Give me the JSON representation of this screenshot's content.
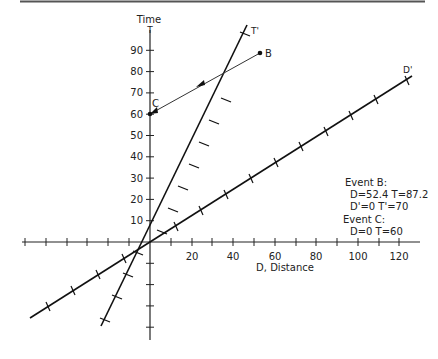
{
  "diagram": {
    "axes": {
      "y_label_top": "Time",
      "y_label_symbol": "T",
      "x_label": "D, Distance",
      "y_ticks": [
        "10",
        "20",
        "30",
        "40",
        "50",
        "60",
        "70",
        "80",
        "90"
      ],
      "x_ticks": [
        "20",
        "40",
        "60",
        "80",
        "100",
        "120"
      ]
    },
    "lines": {
      "t_prime": "T'",
      "d_prime": "D'"
    },
    "points": {
      "B": "B",
      "C": "C"
    },
    "annotations": {
      "event_b_title": "Event B:",
      "event_b_line1": "D=52.4  T=87.2",
      "event_b_line2": "D'=0    T'=70",
      "event_c_title": "Event C:",
      "event_c_line1": "D=0    T=60"
    }
  }
}
